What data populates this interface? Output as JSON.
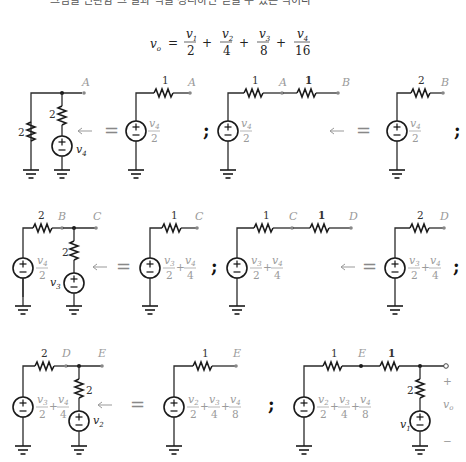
{
  "header": {
    "cut_text": "그림을 변환함 그 결과 식을 정리하면 얻을 수 있는 식이다"
  },
  "formula": {
    "lhs": "v",
    "lhs_sub": "o",
    "terms": [
      {
        "num": "v",
        "num_sub": "1",
        "den": "2"
      },
      {
        "num": "v",
        "num_sub": "2",
        "den": "4"
      },
      {
        "num": "v",
        "num_sub": "3",
        "den": "8"
      },
      {
        "num": "v",
        "num_sub": "4",
        "den": "16"
      }
    ],
    "eq": "=",
    "plus": "+"
  },
  "symbols": {
    "equals": "=",
    "semicolon": ";",
    "plus_sign": "+",
    "minus_sign": "−",
    "source_plus": "±"
  },
  "rows": [
    {
      "nodes": [
        "A",
        "A",
        "B",
        "B"
      ],
      "resistors": {
        "r_shunt": "2",
        "r_series": "2",
        "r_eq1": "1",
        "r_eq2a": "1",
        "r_eq2b": "1",
        "r_eq3": "2"
      },
      "source_var": "v",
      "source_sub": "4",
      "eq_source": {
        "num": "v",
        "num_sub": "4",
        "den": "2"
      }
    },
    {
      "nodes": [
        "B",
        "C",
        "C",
        "C",
        "D",
        "D"
      ],
      "resistors": {
        "r_in": "2",
        "r_shunt": "2",
        "r_eq1": "1",
        "r_eq2a": "1",
        "r_eq2b": "1",
        "r_eq3": "2"
      },
      "source_var": "v",
      "source_sub": "3",
      "in_source": {
        "num": "v",
        "num_sub": "4",
        "den": "2"
      },
      "eq_source": [
        {
          "num": "v",
          "num_sub": "3",
          "den": "2"
        },
        {
          "num": "v",
          "num_sub": "4",
          "den": "4"
        }
      ]
    },
    {
      "nodes": [
        "D",
        "E",
        "E",
        "E"
      ],
      "resistors": {
        "r_in": "2",
        "r_shunt": "2",
        "r_eq1": "1",
        "r_eq2a": "1",
        "r_eq2b": "1",
        "r_out": "2"
      },
      "source_var": "v",
      "source_sub": "2",
      "out_var": "v",
      "out_sub": "1",
      "in_source": [
        {
          "num": "v",
          "num_sub": "3",
          "den": "2"
        },
        {
          "num": "v",
          "num_sub": "4",
          "den": "4"
        }
      ],
      "eq_source": [
        {
          "num": "v",
          "num_sub": "2",
          "den": "2"
        },
        {
          "num": "v",
          "num_sub": "3",
          "den": "4"
        },
        {
          "num": "v",
          "num_sub": "4",
          "den": "8"
        }
      ],
      "vo_label": "v",
      "vo_sub": "o",
      "vo_plus": "+",
      "vo_minus": "−"
    }
  ]
}
